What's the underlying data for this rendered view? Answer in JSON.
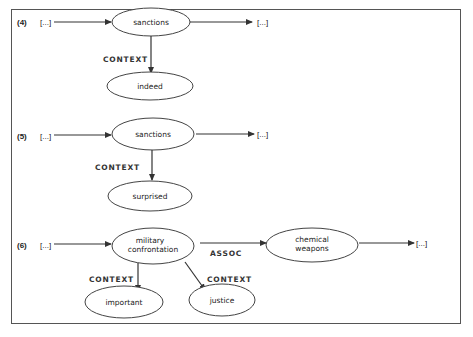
{
  "diagram": {
    "examples": [
      {
        "number": "(4)",
        "input": "[...]",
        "main_node": "sanctions",
        "output": "[...]",
        "edges": [
          {
            "label": "CONTEXT",
            "target": "indeed"
          }
        ]
      },
      {
        "number": "(5)",
        "input": "[...]",
        "main_node": "sanctions",
        "output": "[...]",
        "edges": [
          {
            "label": "CONTEXT",
            "target": "surprised"
          }
        ]
      },
      {
        "number": "(6)",
        "input": "[...]",
        "main_node_line1": "military",
        "main_node_line2": "confrontation",
        "assoc_label": "ASSOC",
        "assoc_node_line1": "chemical",
        "assoc_node_line2": "weapons",
        "output": "[...]",
        "edges": [
          {
            "label": "CONTEXT",
            "target": "important"
          },
          {
            "label": "CONTEXT",
            "target": "justice"
          }
        ]
      }
    ],
    "colors": {
      "stroke": "#333333",
      "background": "#ffffff"
    }
  }
}
